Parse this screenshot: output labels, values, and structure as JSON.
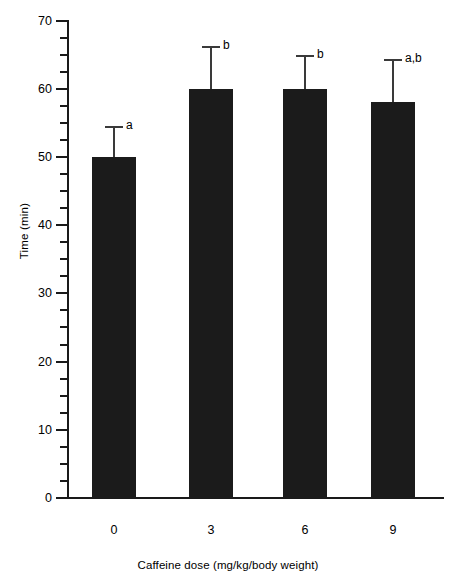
{
  "chart_data": {
    "type": "bar",
    "title": "",
    "subtitle": "",
    "xlabel": "Caffeine dose (mg/kg/body weight)",
    "ylabel": "Time (min)",
    "categories": [
      "0",
      "3",
      "6",
      "9"
    ],
    "values": [
      50,
      60,
      60,
      58
    ],
    "errors": [
      4.5,
      6.3,
      5.0,
      6.3
    ],
    "error_type": "upper-only",
    "annotations": [
      "a",
      "b",
      "b",
      "a,b"
    ],
    "ylim": [
      0,
      70
    ],
    "y_major_ticks": [
      0,
      10,
      20,
      30,
      40,
      50,
      60,
      70
    ],
    "y_major_tick_labels": [
      "0",
      "10",
      "20",
      "30",
      "40",
      "50",
      "60",
      "70"
    ],
    "y_minor_tick_interval": 2.5,
    "grid": false,
    "legend": false,
    "legend_position": "none",
    "bar_color": "#1b1b1b",
    "error_color": "#3a3a3a",
    "axis_color": "#1a1a1a",
    "background_color": "#ffffff"
  }
}
